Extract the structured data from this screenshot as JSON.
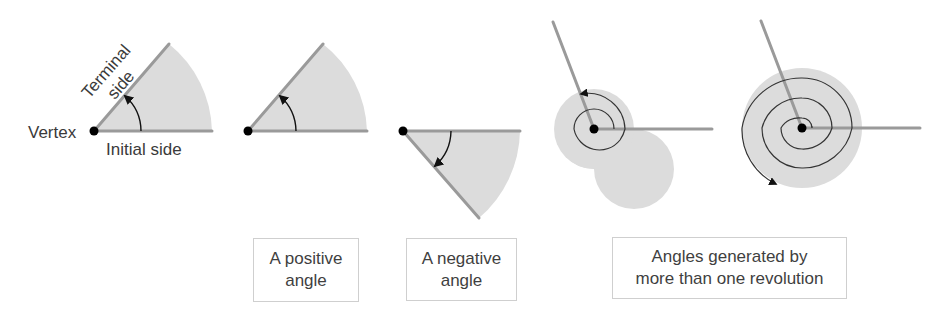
{
  "figure": {
    "labels": {
      "vertex": "Vertex",
      "initial_side": "Initial side",
      "terminal_side_line1": "Terminal",
      "terminal_side_line2": "side"
    },
    "captions": [
      {
        "line1": "A positive",
        "line2": "angle"
      },
      {
        "line1": "A negative",
        "line2": "angle"
      },
      {
        "line1": "Angles generated by",
        "line2": "more than one revolution"
      }
    ],
    "colors": {
      "side": "#9a9a9a",
      "fill": "#dcdcdc",
      "arrow": "#111111",
      "vertex": "#000000",
      "caption_border": "#cfcfcf"
    },
    "diagrams": [
      {
        "id": "anatomy",
        "direction": "counterclockwise",
        "angle_deg": 49
      },
      {
        "id": "positive",
        "direction": "counterclockwise",
        "angle_deg": 49
      },
      {
        "id": "negative",
        "direction": "clockwise",
        "angle_deg": -49
      },
      {
        "id": "one-and-more-revolution",
        "direction": "counterclockwise",
        "angle_deg": 471
      },
      {
        "id": "two-and-more-revolutions",
        "direction": "counterclockwise",
        "angle_deg": 831
      }
    ]
  }
}
